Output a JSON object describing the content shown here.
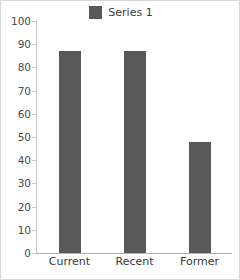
{
  "chart_data": {
    "type": "bar",
    "title": "",
    "subtitle": "",
    "xlabel": "",
    "ylabel": "",
    "categories": [
      "Current",
      "Recent",
      "Former"
    ],
    "series": [
      {
        "name": "Series 1",
        "values": [
          87,
          87,
          48
        ],
        "color": "#595959"
      }
    ],
    "ylim": [
      0,
      100
    ],
    "y_ticks": [
      0,
      10,
      20,
      30,
      40,
      50,
      60,
      70,
      80,
      90,
      100
    ],
    "grid": false,
    "legend": {
      "position": "top-center",
      "entries": [
        {
          "label": "Series 1",
          "color": "#595959",
          "marker": "square-swatch"
        }
      ]
    },
    "axis_color": "#c9c9c9",
    "text_color": "#3a3a3a",
    "background": "#ffffff"
  }
}
